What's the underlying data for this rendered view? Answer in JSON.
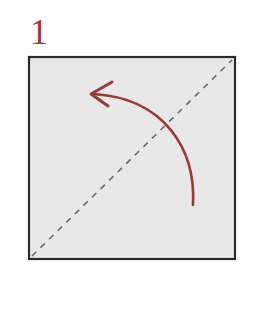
{
  "step": {
    "number": "1"
  },
  "diagram": {
    "paper": {
      "x": 29,
      "y": 57,
      "width": 206,
      "height": 202,
      "fill": "#e8e8e8",
      "border_color": "#2a2a2a"
    },
    "fold_line": {
      "style": "valley-fold-dashed",
      "from": [
        32,
        256
      ],
      "to": [
        232,
        60
      ],
      "color": "#6a6a6a"
    },
    "arrow": {
      "icon": "curved-fold-arrow-icon",
      "color": "#9b3a34",
      "start": [
        193,
        205
      ],
      "end": [
        91,
        94
      ]
    }
  }
}
